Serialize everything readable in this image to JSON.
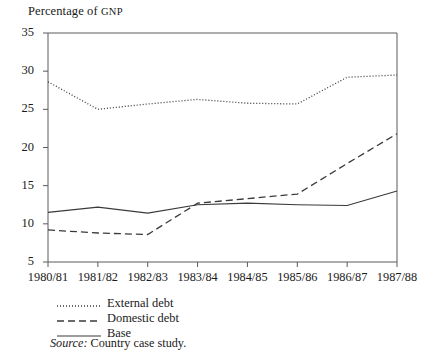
{
  "figure": {
    "axis_title_main": "Percentage of ",
    "axis_title_smallcaps": "GNP",
    "source_lead": "Source:",
    "source_text": " Country case study."
  },
  "legend": {
    "position": "below-axis-left",
    "entries": [
      {
        "label": "External debt",
        "style": "dotted",
        "color": "#3a3a3a"
      },
      {
        "label": "Domestic debt",
        "style": "dashed",
        "color": "#3a3a3a"
      },
      {
        "label": "Base",
        "style": "solid",
        "color": "#3a3a3a"
      }
    ]
  },
  "chart_data": {
    "type": "line",
    "title": "Percentage of GNP",
    "xlabel": "",
    "ylabel": "Percentage of GNP",
    "categories": [
      "1980/81",
      "1981/82",
      "1982/83",
      "1983/84",
      "1984/85",
      "1985/86",
      "1986/87",
      "1987/88"
    ],
    "ylim": [
      5,
      35
    ],
    "yticks": [
      5,
      10,
      15,
      20,
      25,
      30,
      35
    ],
    "grid": false,
    "legend_position": "below-plot-left",
    "series": [
      {
        "name": "External debt",
        "style": "dotted",
        "values": [
          28.6,
          25.0,
          25.7,
          26.3,
          25.8,
          25.7,
          29.2,
          29.5
        ]
      },
      {
        "name": "Domestic debt",
        "style": "dashed",
        "values": [
          9.2,
          8.8,
          8.6,
          12.7,
          13.3,
          13.9,
          17.9,
          21.8
        ]
      },
      {
        "name": "Base",
        "style": "solid",
        "values": [
          11.5,
          12.2,
          11.4,
          12.5,
          12.7,
          12.5,
          12.4,
          14.3
        ]
      }
    ]
  }
}
